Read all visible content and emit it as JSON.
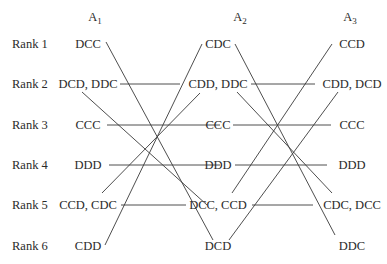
{
  "columns": [
    {
      "id": "A1",
      "base": "A",
      "sub": "1",
      "x": 95
    },
    {
      "id": "A2",
      "base": "A",
      "sub": "2",
      "x": 240
    },
    {
      "id": "A3",
      "base": "A",
      "sub": "3",
      "x": 350
    }
  ],
  "ranks": [
    "Rank 1",
    "Rank 2",
    "Rank 3",
    "Rank 4",
    "Rank 5",
    "Rank 6"
  ],
  "row_y": [
    44,
    84,
    125,
    165,
    205,
    246
  ],
  "header_y": 18,
  "cells": {
    "A1": [
      "DCC",
      "DCD, DDC",
      "CCC",
      "DDD",
      "CCD, CDC",
      "CDD"
    ],
    "A2": [
      "CDC",
      "CDD, DDC",
      "CCC",
      "DDD",
      "DCC, CCD",
      "DCD"
    ],
    "A3": [
      "CCD",
      "CDD, DCD",
      "CCC",
      "DDD",
      "CDC, DCC",
      "DDC"
    ]
  },
  "lines": [
    {
      "x1": 106,
      "y1": 42,
      "x2": 213,
      "y2": 240
    },
    {
      "x1": 120,
      "y1": 84,
      "x2": 180,
      "y2": 84
    },
    {
      "x1": 82,
      "y1": 92,
      "x2": 207,
      "y2": 205
    },
    {
      "x1": 107,
      "y1": 125,
      "x2": 220,
      "y2": 125
    },
    {
      "x1": 109,
      "y1": 165,
      "x2": 220,
      "y2": 165
    },
    {
      "x1": 102,
      "y1": 193,
      "x2": 200,
      "y2": 93
    },
    {
      "x1": 121,
      "y1": 205,
      "x2": 186,
      "y2": 205
    },
    {
      "x1": 105,
      "y1": 245,
      "x2": 202,
      "y2": 44
    },
    {
      "x1": 235,
      "y1": 44,
      "x2": 335,
      "y2": 235
    },
    {
      "x1": 251,
      "y1": 84,
      "x2": 315,
      "y2": 84
    },
    {
      "x1": 237,
      "y1": 92,
      "x2": 332,
      "y2": 193
    },
    {
      "x1": 233,
      "y1": 125,
      "x2": 331,
      "y2": 125
    },
    {
      "x1": 235,
      "y1": 165,
      "x2": 327,
      "y2": 165
    },
    {
      "x1": 232,
      "y1": 193,
      "x2": 332,
      "y2": 44
    },
    {
      "x1": 252,
      "y1": 205,
      "x2": 313,
      "y2": 205
    },
    {
      "x1": 229,
      "y1": 240,
      "x2": 338,
      "y2": 92
    }
  ]
}
